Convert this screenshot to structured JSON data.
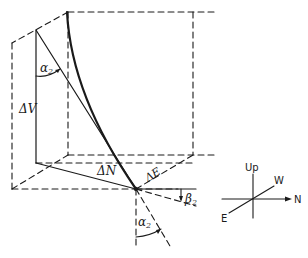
{
  "diagram": {
    "type": "3d-vector-geometry",
    "labels": {
      "delta_v": "ΔV",
      "delta_n": "ΔN",
      "delta_e": "ΔE",
      "alpha_top": "α",
      "alpha_top_sub": "2",
      "alpha_bottom": "α",
      "alpha_bottom_sub": "2",
      "beta": "β",
      "beta_sub": "2"
    },
    "compass": {
      "up": "Up",
      "west": "W",
      "north": "N",
      "east": "E"
    },
    "colors": {
      "line": "#1a1a1a",
      "background": "#ffffff"
    }
  }
}
